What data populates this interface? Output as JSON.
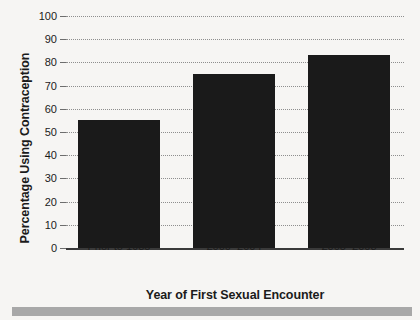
{
  "chart_data": {
    "type": "bar",
    "title": "",
    "categories": [
      "Prior to 1985",
      "2000–2004",
      "2005–2008"
    ],
    "values": [
      55,
      75,
      83
    ],
    "series": [
      {
        "name": "Percentage Using Contraception",
        "values": [
          55,
          75,
          83
        ]
      }
    ],
    "xlabel": "Year of First Sexual Encounter",
    "ylabel": "Percentage Using Contraception",
    "ylim": [
      0,
      100
    ],
    "yticks": [
      0,
      10,
      20,
      30,
      40,
      50,
      60,
      70,
      80,
      90,
      100
    ],
    "ytick_labels": [
      "0",
      "10",
      "20",
      "30",
      "40",
      "50",
      "60",
      "70",
      "80",
      "90",
      "100"
    ],
    "grid": true,
    "grid_style": "dotted",
    "legend": false,
    "legend_position": "none",
    "bar_color": "#1a1a1a",
    "background_color": "#f6f5f3",
    "grid_color": "#8e8e8e",
    "axis_color": "#3a3a3a",
    "text_color": "#1b1b1b",
    "footer_strip_color": "#a8a8a8"
  }
}
